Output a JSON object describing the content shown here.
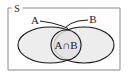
{
  "figure": {
    "type": "venn-diagram",
    "background_color": "#ffffff"
  },
  "universal_set": {
    "label": "S",
    "shape": "rectangle",
    "border_color": "#8a8a8a",
    "fill_color": "#ffffff"
  },
  "sets": [
    {
      "id": "A",
      "label": "A",
      "shape": "ellipse",
      "fill_color": "#ebebeb",
      "stroke_color": "#1a1a1a",
      "leader_line": true
    },
    {
      "id": "B",
      "label": "B",
      "shape": "ellipse",
      "fill_color": "#ebebeb",
      "stroke_color": "#1a1a1a",
      "leader_line": true
    }
  ],
  "intersection": {
    "label": "A∩B",
    "shape": "circle",
    "fill_color": "#e6e6e6",
    "stroke_color": "#1a1a1a"
  }
}
